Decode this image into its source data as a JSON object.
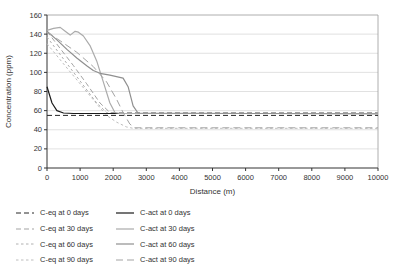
{
  "chart_data": {
    "type": "line",
    "title": "",
    "xlabel": "Distance (m)",
    "ylabel": "Concentration (ppm)",
    "xlim": [
      0,
      10000
    ],
    "ylim": [
      0,
      160
    ],
    "xticks": [
      0,
      1000,
      2000,
      3000,
      4000,
      5000,
      6000,
      7000,
      8000,
      9000,
      10000
    ],
    "yticks": [
      0,
      20,
      40,
      60,
      80,
      100,
      120,
      140,
      160
    ],
    "grid": "horizontal light-gray lines every 20 ppm, full plot border box",
    "legend_position": "below plot, two columns, left aligned",
    "series": [
      {
        "name": "C-eq at 0 days",
        "color": "#262626",
        "dash": "5,3",
        "width": 1,
        "points": [
          [
            0,
            55
          ],
          [
            10000,
            55
          ]
        ]
      },
      {
        "name": "C-eq at 30 days",
        "color": "#a3a3a3",
        "dash": "5,3",
        "width": 1,
        "points": [
          [
            0,
            143
          ],
          [
            400,
            125
          ],
          [
            800,
            107
          ],
          [
            1200,
            88
          ],
          [
            1600,
            68
          ],
          [
            1900,
            58
          ],
          [
            2100,
            58
          ],
          [
            10000,
            58
          ]
        ]
      },
      {
        "name": "C-eq at 60 days",
        "color": "#b0b0b0",
        "dash": "2.5,2.5",
        "width": 1,
        "points": [
          [
            0,
            137
          ],
          [
            500,
            114
          ],
          [
            1000,
            91
          ],
          [
            1500,
            68
          ],
          [
            1800,
            58
          ],
          [
            2000,
            57
          ],
          [
            10000,
            57
          ]
        ]
      },
      {
        "name": "C-eq at 90 days",
        "color": "#bdbdbd",
        "dash": "2.5,2.5",
        "width": 1,
        "points": [
          [
            0,
            130
          ],
          [
            500,
            109
          ],
          [
            1000,
            88
          ],
          [
            1500,
            67
          ],
          [
            1800,
            55
          ],
          [
            2100,
            48
          ],
          [
            2400,
            43
          ],
          [
            2600,
            41.5
          ],
          [
            10000,
            41.5
          ]
        ]
      },
      {
        "name": "C-act at 0 days",
        "color": "#1a1a1a",
        "dash": "",
        "width": 1.2,
        "points": [
          [
            0,
            85
          ],
          [
            150,
            68
          ],
          [
            300,
            60
          ],
          [
            500,
            57.5
          ],
          [
            800,
            57
          ],
          [
            1500,
            57
          ],
          [
            10000,
            57
          ]
        ]
      },
      {
        "name": "C-act at 30 days",
        "color": "#ababab",
        "dash": "",
        "width": 1.2,
        "points": [
          [
            0,
            144
          ],
          [
            200,
            146
          ],
          [
            400,
            147
          ],
          [
            550,
            143
          ],
          [
            700,
            139
          ],
          [
            850,
            143
          ],
          [
            950,
            142
          ],
          [
            1100,
            138
          ],
          [
            1300,
            128
          ],
          [
            1500,
            112
          ],
          [
            1700,
            90
          ],
          [
            1900,
            68
          ],
          [
            2050,
            58
          ],
          [
            2200,
            57
          ],
          [
            10000,
            57
          ]
        ]
      },
      {
        "name": "C-act at 60 days",
        "color": "#8f8f8f",
        "dash": "",
        "width": 1.2,
        "points": [
          [
            0,
            143
          ],
          [
            300,
            134
          ],
          [
            600,
            124
          ],
          [
            900,
            115
          ],
          [
            1200,
            107
          ],
          [
            1400,
            102
          ],
          [
            1600,
            99
          ],
          [
            1900,
            97
          ],
          [
            2300,
            94
          ],
          [
            2450,
            85
          ],
          [
            2600,
            65
          ],
          [
            2750,
            57.5
          ],
          [
            10000,
            56.5
          ]
        ]
      },
      {
        "name": "C-act at 90 days",
        "color": "#a3a3a3",
        "dash": "7,4",
        "width": 1,
        "points": [
          [
            0,
            142
          ],
          [
            400,
            133
          ],
          [
            900,
            121
          ],
          [
            1400,
            106
          ],
          [
            1800,
            90
          ],
          [
            2100,
            72
          ],
          [
            2300,
            58
          ],
          [
            2500,
            46
          ],
          [
            2650,
            42
          ],
          [
            10000,
            42
          ]
        ]
      }
    ]
  },
  "style": {
    "axis_color": "#333333",
    "grid_color": "#d9d9d9",
    "border_color": "#9a9a9a",
    "text_color": "#333333"
  }
}
